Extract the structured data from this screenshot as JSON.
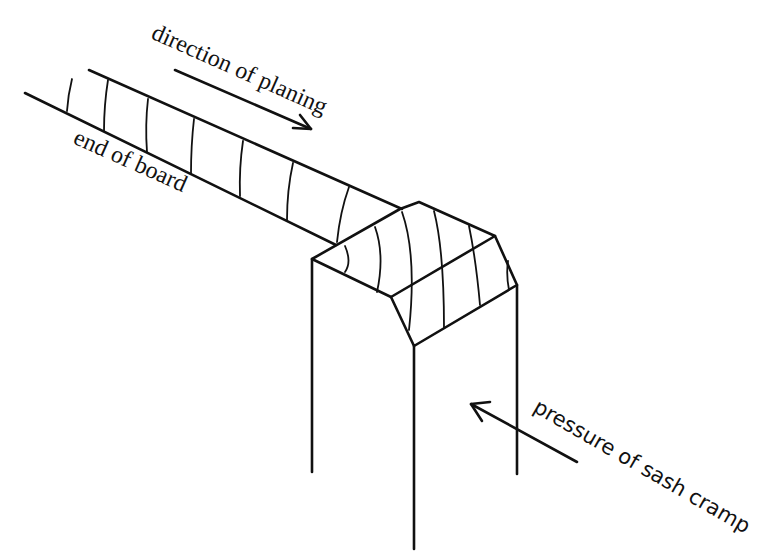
{
  "figure": {
    "labels": {
      "direction": "direction of planing",
      "end_of_board": "end of board",
      "pressure": "pressure of sash cramp"
    },
    "colors": {
      "ink": "#111111",
      "background": "#ffffff"
    },
    "arrows": [
      {
        "name": "planing-direction-arrow",
        "from": [
          175,
          70
        ],
        "to": [
          311,
          129
        ]
      },
      {
        "name": "cramp-pressure-arrow",
        "from": [
          577,
          462
        ],
        "to": [
          471,
          404
        ]
      }
    ]
  }
}
